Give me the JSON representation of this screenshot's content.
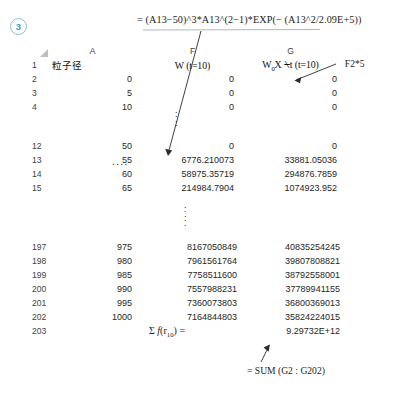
{
  "step": {
    "number": "3"
  },
  "annotations": {
    "formula_column_f": "= (A13−50)^3*A13^(2−1)*EXP(− (A13^2/2.09E+5))",
    "formula_column_g": "= F2*5",
    "formula_sum": "= SUM (G2 : G202)"
  },
  "sheet": {
    "columns": [
      {
        "letter": "A",
        "label": "粒子径"
      },
      {
        "letter": "F",
        "label": "W (t=10)"
      },
      {
        "letter": "G",
        "label": "W₀X ⍀t (t=10)"
      }
    ],
    "ellipsis_horizontal": "....",
    "sum_row_label": "Σ f(r₁₀) =",
    "sum_row_value": "9.29732E+12",
    "groups": [
      {
        "name": "top",
        "rows": [
          {
            "n": "1",
            "a": "粒子径",
            "a_kind": "label",
            "f": "",
            "g": "",
            "is_header_row": true
          },
          {
            "n": "2",
            "a": "0",
            "f": "0",
            "g": "0"
          },
          {
            "n": "3",
            "a": "5",
            "f": "0",
            "g": "0"
          },
          {
            "n": "4",
            "a": "10",
            "f": "0",
            "g": "0"
          }
        ]
      },
      {
        "name": "middle",
        "rows": [
          {
            "n": "12",
            "a": "50",
            "f": "0",
            "g": "0"
          },
          {
            "n": "13",
            "a": "55",
            "f": "6776.210073",
            "g": "33881.05036"
          },
          {
            "n": "14",
            "a": "60",
            "f": "58975.35719",
            "g": "294876.7859"
          },
          {
            "n": "15",
            "a": "65",
            "f": "214984.7904",
            "g": "1074923.952"
          }
        ]
      },
      {
        "name": "bottom",
        "rows": [
          {
            "n": "197",
            "a": "975",
            "f": "8167050849",
            "g": "40835254245"
          },
          {
            "n": "198",
            "a": "980",
            "f": "7961561764",
            "g": "39807808821"
          },
          {
            "n": "199",
            "a": "985",
            "f": "7758511600",
            "g": "38792558001"
          },
          {
            "n": "200",
            "a": "990",
            "f": "7557988231",
            "g": "37789941155"
          },
          {
            "n": "201",
            "a": "995",
            "f": "7360073803",
            "g": "36800369013"
          },
          {
            "n": "202",
            "a": "1000",
            "f": "7164844803",
            "g": "35824224015"
          },
          {
            "n": "203",
            "a": "",
            "f": "SUM_LABEL",
            "g": "SUM_VALUE",
            "is_sum_row": true
          }
        ]
      }
    ]
  },
  "colors": {
    "badge_border": "#7fc4dd",
    "badge_text": "#3f9cc0",
    "grid_line": "#dcdcdc",
    "header_line": "#b9b9b9",
    "text": "#1a1a1a"
  }
}
